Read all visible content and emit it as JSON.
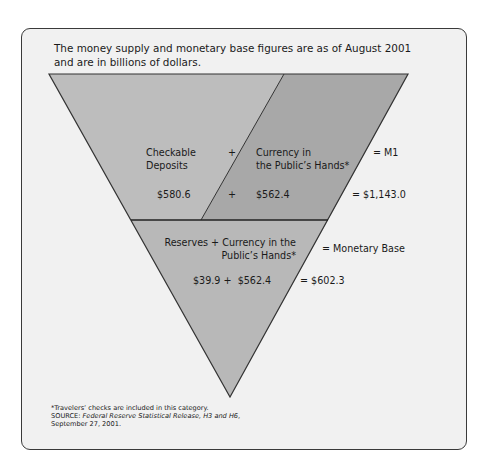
{
  "intro": {
    "line1": "The money supply and monetary base figures are as of August 2001",
    "line2": "and are in billions of dollars."
  },
  "m1_section": {
    "checkable_deposits": {
      "label_line1": "Checkable",
      "label_line2": "Deposits",
      "value": "$580.6"
    },
    "plus_label": "+",
    "plus_value": "+",
    "currency": {
      "label_line1": "Currency in",
      "label_line2": "the Public’s Hands*",
      "value": "$562.4"
    },
    "result_label": "= M1",
    "result_value": "= $1,143.0"
  },
  "base_section": {
    "label_line1": "Reserves + Currency in the",
    "label_line2": "Public’s Hands*",
    "values": "$39.9 +  $562.4",
    "result_label": "= Monetary Base",
    "result_value": "= $602.3"
  },
  "footnote": {
    "line1": "*Travelers’ checks are included in this category.",
    "source_prefix": "SOURCE: ",
    "source_italic": "Federal Reserve Statistical Release, H3 and H6",
    "source_suffix": ",",
    "line3": "September 27, 2001."
  },
  "colors": {
    "panel_bg": "#f1f1f1",
    "checkable_fill": "#bdbdbd",
    "currency_fill": "#a9a9a9",
    "base_fill": "#b7b7b7",
    "stroke": "#333333"
  }
}
